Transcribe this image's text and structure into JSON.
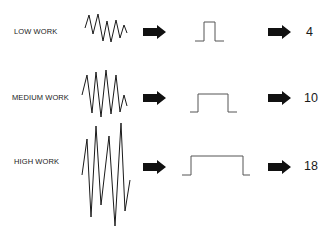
{
  "diagram": {
    "rows": [
      {
        "label": "LOW WORK",
        "value": "4",
        "wave_points": "85,28 89,15 93,34 98,14 103,41 107,21 111,42 116,20 120,38 124,25 127,33",
        "pulse_points": "195,41 204,41 204,22 215,22 215,41 224,41"
      },
      {
        "label": "MEDIUM WORK",
        "value": "10",
        "wave_points": "82,95 87,75 92,113 96,72 101,117 106,70 111,114 116,75 120,112 124,95 127,106",
        "pulse_points": "190,112 198,112 198,94 228,94 228,112 237,112"
      },
      {
        "label": "HIGH WORK",
        "value": "18",
        "wave_points": "82,175 87,139 91,217 96,126 101,205 109,136 115,226 121,123 125,211 130,180",
        "pulse_points": "182,175 191,175 191,156 243,156 243,175 250,175"
      }
    ],
    "arrow_icon": "right-arrow-icon",
    "colors": {
      "ink": "#1a1a1a",
      "arrow": "#111111",
      "pulse_line": "#555555",
      "background": "#ffffff"
    }
  }
}
